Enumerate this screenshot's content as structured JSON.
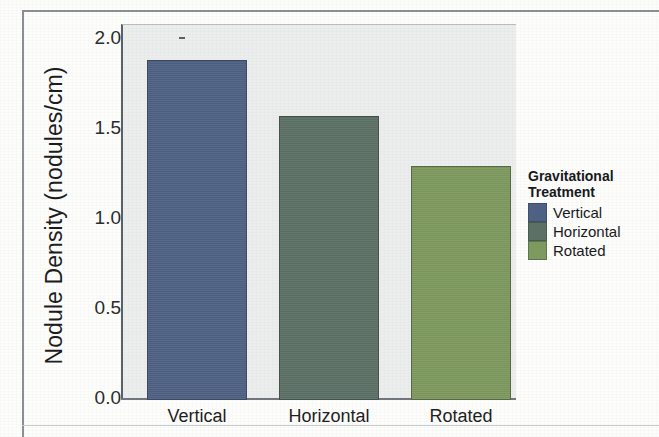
{
  "chart_data": {
    "type": "bar",
    "title": "",
    "xlabel": "",
    "ylabel": "Nodule Density (nodules/cm)",
    "categories": [
      "Vertical",
      "Horizontal",
      "Rotated"
    ],
    "values": [
      1.82,
      1.52,
      1.25
    ],
    "errors_upper": [
      1.96,
      1.62,
      1.37
    ],
    "errors_lower": [
      1.67,
      1.42,
      1.13
    ],
    "annotations": [
      "a",
      "ab",
      "b"
    ],
    "ylim": [
      0.0,
      2.0
    ],
    "ytick_labels": [
      "0.0",
      "0.5",
      "1.0",
      "1.5",
      "2.0"
    ],
    "ytick_values": [
      0.0,
      0.5,
      1.0,
      1.5,
      2.0
    ],
    "grid": false,
    "legend_position": "right",
    "series": [
      {
        "name": "Vertical",
        "value": 1.82,
        "color": "#4e6184"
      },
      {
        "name": "Horizontal",
        "value": 1.52,
        "color": "#5c7065"
      },
      {
        "name": "Rotated",
        "value": 1.25,
        "color": "#7e9a5e"
      }
    ]
  },
  "legend": {
    "title_line1": "Gravitational",
    "title_line2": "Treatment",
    "items": [
      {
        "label": "Vertical",
        "color": "#4e6184"
      },
      {
        "label": "Horizontal",
        "color": "#5c7065"
      },
      {
        "label": "Rotated",
        "color": "#7e9a5e"
      }
    ]
  },
  "panel": {
    "background_color": "#eceeee",
    "axis_color": "#5a6066"
  }
}
